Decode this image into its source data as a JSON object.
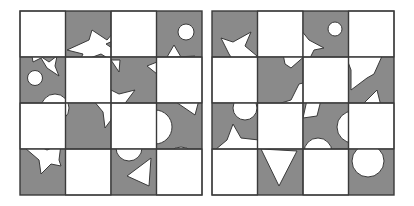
{
  "puzzle": {
    "type": "tile-matching",
    "rows": 4,
    "cols": 4,
    "colors": {
      "dark": "#8a8a8a",
      "light": "#ffffff",
      "stroke": "#3a3a3a",
      "shape_fill": "#ffffff"
    }
  },
  "boards": [
    {
      "name": "left-board",
      "x": 20,
      "y": 11,
      "size": 182,
      "cells": [
        [
          "white",
          "gray",
          "white",
          "gray"
        ],
        [
          "gray",
          "white",
          "gray",
          "white"
        ],
        [
          "white",
          "gray",
          "white",
          "gray"
        ],
        [
          "gray",
          "white",
          "gray",
          "white"
        ]
      ],
      "tile_contents": [
        [
          "empty",
          "star-fragment",
          "empty",
          "circle+triangle-fragment"
        ],
        [
          "circle+star-fragment",
          "empty",
          "star-fragment",
          "empty"
        ],
        [
          "empty",
          "star-fragment",
          "empty",
          "semicircle-fragments"
        ],
        [
          "star-fragment",
          "empty",
          "triangle+semicircle",
          "empty"
        ]
      ]
    },
    {
      "name": "right-board",
      "x": 212,
      "y": 11,
      "size": 182,
      "cells": [
        [
          "gray",
          "white",
          "gray",
          "white"
        ],
        [
          "white",
          "gray",
          "white",
          "gray"
        ],
        [
          "gray",
          "white",
          "gray",
          "white"
        ],
        [
          "white",
          "gray",
          "white",
          "gray"
        ]
      ],
      "tile_contents": [
        [
          "star-fragment",
          "empty",
          "circle+star-fragment",
          "empty"
        ],
        [
          "empty",
          "star-fragment",
          "empty",
          "star-fragment"
        ],
        [
          "star+semicircle",
          "empty",
          "semicircle-fragments",
          "empty"
        ],
        [
          "empty",
          "inverted-triangle",
          "empty",
          "semicircle"
        ]
      ]
    }
  ]
}
